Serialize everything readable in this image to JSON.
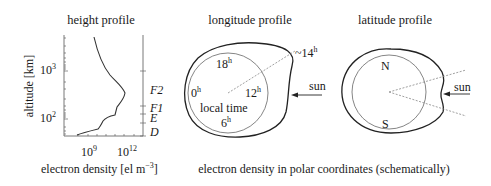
{
  "panels": {
    "height": {
      "title": "height profile",
      "ylabel": "altitude [km]",
      "xlabel_main": "electron density [el m",
      "xlabel_exp": "−3",
      "xlabel_end": "]",
      "y_ticks": [
        {
          "base": "10",
          "exp": "3"
        },
        {
          "base": "10",
          "exp": "2"
        }
      ],
      "x_ticks": [
        {
          "base": "10",
          "exp": "9"
        },
        {
          "base": "10",
          "exp": "12"
        }
      ],
      "layers": [
        "F2",
        "F1",
        "E",
        "D"
      ]
    },
    "longitude": {
      "title": "longitude profile",
      "hours": [
        {
          "base": "18",
          "exp": "h"
        },
        {
          "base": "0",
          "exp": "h"
        },
        {
          "base": "12",
          "exp": "h"
        },
        {
          "base": "6",
          "exp": "h"
        }
      ],
      "center_label": "local time",
      "peak_label_prefix": "~",
      "peak_label": "14",
      "peak_label_exp": "h",
      "sun_label": "sun"
    },
    "latitude": {
      "title": "latitude profile",
      "north": "N",
      "south": "S",
      "sun_label": "sun"
    }
  },
  "caption": "electron density in polar coordinates (schematically)"
}
